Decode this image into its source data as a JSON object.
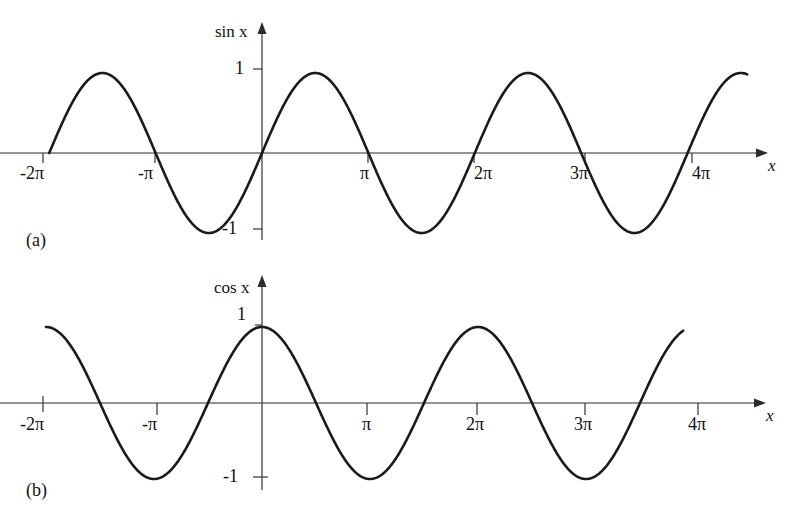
{
  "figure": {
    "title": "",
    "background_color": "#ffffff",
    "curve_color": "#1a1a1a",
    "axis_color": "#2b2b2b"
  },
  "panels": [
    {
      "id": "a",
      "caption": "(a)",
      "y_axis_label": "sin x",
      "x_axis_label": "x",
      "y_ticks": [
        "1",
        "-1"
      ],
      "x_ticks": [
        "-2π",
        "-π",
        "π",
        "2π",
        "3π",
        "4π"
      ]
    },
    {
      "id": "b",
      "caption": "(b)",
      "y_axis_label": "cos x",
      "x_axis_label": "x",
      "y_ticks": [
        "1",
        "-1"
      ],
      "x_ticks": [
        "-2π",
        "-π",
        "π",
        "2π",
        "3π",
        "4π"
      ]
    }
  ],
  "chart_data": [
    {
      "type": "line",
      "title": "(a) Graph of sin x",
      "function": "sin(x)",
      "xlabel": "x",
      "ylabel": "sin x",
      "xlim": [
        -6.283185307,
        14.137166941
      ],
      "ylim": [
        -1,
        1
      ],
      "grid": false,
      "legend": "none",
      "x_tick_values": [
        -6.283185307,
        -3.141592654,
        3.141592654,
        6.283185307,
        9.424777961,
        12.566370614
      ],
      "x_tick_labels": [
        "-2π",
        "-π",
        "π",
        "2π",
        "3π",
        "4π"
      ],
      "y_tick_values": [
        1,
        -1
      ],
      "y_tick_labels": [
        "1",
        "-1"
      ],
      "key_points": [
        {
          "x": -6.283185307,
          "y": 0,
          "note": "start at -2π"
        },
        {
          "x": -4.71238898,
          "y": 1,
          "note": "maximum"
        },
        {
          "x": -3.141592654,
          "y": 0,
          "note": "zero at -π"
        },
        {
          "x": -1.570796327,
          "y": -1,
          "note": "minimum"
        },
        {
          "x": 0,
          "y": 0,
          "note": "origin"
        },
        {
          "x": 1.570796327,
          "y": 1,
          "note": "maximum"
        },
        {
          "x": 3.141592654,
          "y": 0,
          "note": "zero at π"
        },
        {
          "x": 4.71238898,
          "y": -1,
          "note": "minimum"
        },
        {
          "x": 6.283185307,
          "y": 0,
          "note": "zero at 2π"
        },
        {
          "x": 7.853981634,
          "y": 1,
          "note": "maximum"
        },
        {
          "x": 9.424777961,
          "y": 0,
          "note": "zero at 3π"
        },
        {
          "x": 10.995574288,
          "y": -1,
          "note": "minimum"
        },
        {
          "x": 12.566370614,
          "y": 0,
          "note": "zero at 4π"
        },
        {
          "x": 14.137166941,
          "y": 1,
          "note": "end near maximum"
        }
      ]
    },
    {
      "type": "line",
      "title": "(b) Graph of cos x",
      "function": "cos(x)",
      "xlabel": "x",
      "ylabel": "cos x",
      "xlim": [
        -6.283185307,
        12.566370614
      ],
      "ylim": [
        -1,
        1
      ],
      "grid": false,
      "legend": "none",
      "x_tick_values": [
        -6.283185307,
        -3.141592654,
        3.141592654,
        6.283185307,
        9.424777961,
        12.566370614
      ],
      "x_tick_labels": [
        "-2π",
        "-π",
        "π",
        "2π",
        "3π",
        "4π"
      ],
      "y_tick_values": [
        1,
        -1
      ],
      "y_tick_labels": [
        "1",
        "-1"
      ],
      "key_points": [
        {
          "x": -6.283185307,
          "y": 1,
          "note": "start at -2π, maximum"
        },
        {
          "x": -4.71238898,
          "y": 0,
          "note": "zero"
        },
        {
          "x": -3.141592654,
          "y": -1,
          "note": "minimum at -π"
        },
        {
          "x": -1.570796327,
          "y": 0,
          "note": "zero"
        },
        {
          "x": 0,
          "y": 1,
          "note": "maximum at origin"
        },
        {
          "x": 1.570796327,
          "y": 0,
          "note": "zero"
        },
        {
          "x": 3.141592654,
          "y": -1,
          "note": "minimum at π"
        },
        {
          "x": 4.71238898,
          "y": 0,
          "note": "zero"
        },
        {
          "x": 6.283185307,
          "y": 1,
          "note": "maximum at 2π"
        },
        {
          "x": 7.853981634,
          "y": 0,
          "note": "zero"
        },
        {
          "x": 9.424777961,
          "y": -1,
          "note": "minimum at 3π"
        },
        {
          "x": 10.995574288,
          "y": 0,
          "note": "zero"
        },
        {
          "x": 12.25221135,
          "y": 0.93,
          "note": "end just before 4π"
        }
      ]
    }
  ]
}
